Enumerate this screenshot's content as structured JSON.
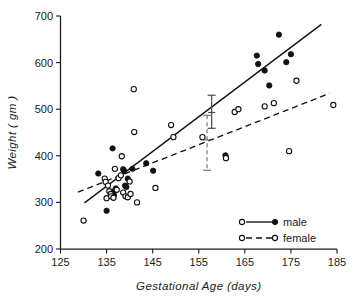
{
  "figure": {
    "title": "",
    "background_color": "#ffffff",
    "ink_color": "#111111"
  },
  "axes": {
    "x_title": "Gestational  Age  (days)",
    "y_title": "Weight  ( gm )",
    "x_ticks": [
      "125",
      "135",
      "145",
      "155",
      "165",
      "175",
      "185"
    ],
    "y_ticks": [
      "200",
      "300",
      "400",
      "500",
      "600",
      "700"
    ]
  },
  "legend": {
    "items": [
      {
        "label": "male",
        "line_style": "solid",
        "left_marker": "open-circle",
        "right_marker": "filled-circle"
      },
      {
        "label": "female",
        "line_style": "dashed",
        "left_marker": "open-circle",
        "right_marker": "open-circle"
      }
    ]
  },
  "chart_data": {
    "type": "scatter",
    "title": "",
    "xlabel": "Gestational Age (days)",
    "ylabel": "Weight (gm)",
    "xlim": [
      125,
      185
    ],
    "ylim": [
      200,
      700
    ],
    "xticks": [
      125,
      135,
      145,
      155,
      165,
      175,
      185
    ],
    "yticks": [
      200,
      300,
      400,
      500,
      600,
      700
    ],
    "grid": false,
    "legend_position": "lower-right",
    "series": [
      {
        "name": "male",
        "marker": "filled-circle",
        "color": "#111111",
        "points": [
          [
            133.2,
            362
          ],
          [
            135.0,
            282
          ],
          [
            136.3,
            416
          ],
          [
            136.4,
            323
          ],
          [
            136.6,
            316
          ],
          [
            137.0,
            330
          ],
          [
            138.6,
            371
          ],
          [
            138.8,
            368
          ],
          [
            139.0,
            336
          ],
          [
            139.3,
            333
          ],
          [
            139.6,
            351
          ],
          [
            140.6,
            372
          ],
          [
            143.6,
            384
          ],
          [
            145.1,
            368
          ],
          [
            160.8,
            401
          ],
          [
            167.6,
            615
          ],
          [
            167.9,
            597
          ],
          [
            169.3,
            583
          ],
          [
            170.3,
            551
          ],
          [
            172.4,
            660
          ],
          [
            174.0,
            601
          ],
          [
            175.0,
            618
          ]
        ]
      },
      {
        "name": "female",
        "marker": "open-circle",
        "color": "#111111",
        "points": [
          [
            130.0,
            261
          ],
          [
            134.6,
            351
          ],
          [
            134.8,
            344
          ],
          [
            135.0,
            309
          ],
          [
            135.3,
            336
          ],
          [
            135.6,
            324
          ],
          [
            135.9,
            318
          ],
          [
            136.0,
            313
          ],
          [
            136.5,
            310
          ],
          [
            136.8,
            372
          ],
          [
            137.2,
            327
          ],
          [
            137.6,
            352
          ],
          [
            138.1,
            358
          ],
          [
            138.3,
            399
          ],
          [
            138.6,
            321
          ],
          [
            139.1,
            313
          ],
          [
            139.6,
            311
          ],
          [
            140.0,
            345
          ],
          [
            140.2,
            318
          ],
          [
            140.9,
            543
          ],
          [
            141.0,
            451
          ],
          [
            141.6,
            300
          ],
          [
            145.6,
            331
          ],
          [
            149.0,
            466
          ],
          [
            149.5,
            440
          ],
          [
            155.8,
            440
          ],
          [
            162.8,
            494
          ],
          [
            163.6,
            500
          ],
          [
            160.9,
            395
          ],
          [
            169.3,
            506
          ],
          [
            171.3,
            513
          ],
          [
            174.6,
            410
          ],
          [
            176.2,
            561
          ],
          [
            184.2,
            509
          ]
        ]
      }
    ],
    "fit_lines": [
      {
        "name": "male",
        "style": "solid",
        "x_start": 130.2,
        "y_start": 299,
        "x_end": 181.6,
        "y_end": 682
      },
      {
        "name": "female",
        "style": "dashed",
        "x_start": 128.8,
        "y_start": 322,
        "x_end": 183.4,
        "y_end": 534
      }
    ],
    "error_bars": [
      {
        "name": "male",
        "x": 157.8,
        "y": 493,
        "y_low": 459,
        "y_high": 530,
        "style": "solid"
      },
      {
        "name": "female",
        "x": 156.8,
        "y": 434,
        "y_low": 369,
        "y_high": 487,
        "style": "dashed"
      }
    ]
  }
}
